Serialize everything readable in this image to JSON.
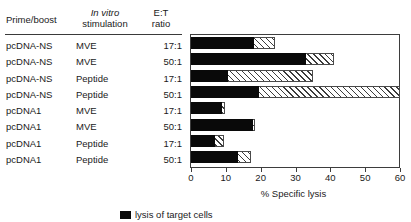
{
  "table": {
    "headers": {
      "prime_boost": "Prime/boost",
      "in_vitro_italic": "In vitro",
      "in_vitro_second": "stimulation",
      "et_line1": "E:T",
      "et_line2": "ratio"
    },
    "rows": [
      {
        "prime_boost": "pcDNA-NS",
        "stimulation": "MVE",
        "et_ratio": "17:1"
      },
      {
        "prime_boost": "pcDNA-NS",
        "stimulation": "MVE",
        "et_ratio": "50:1"
      },
      {
        "prime_boost": "pcDNA-NS",
        "stimulation": "Peptide",
        "et_ratio": "17:1"
      },
      {
        "prime_boost": "pcDNA-NS",
        "stimulation": "Peptide",
        "et_ratio": "50:1"
      },
      {
        "prime_boost": "pcDNA1",
        "stimulation": "MVE",
        "et_ratio": "17:1"
      },
      {
        "prime_boost": "pcDNA1",
        "stimulation": "MVE",
        "et_ratio": "50:1"
      },
      {
        "prime_boost": "pcDNA1",
        "stimulation": "Peptide",
        "et_ratio": "17:1"
      },
      {
        "prime_boost": "pcDNA1",
        "stimulation": "Peptide",
        "et_ratio": "50:1"
      }
    ]
  },
  "legend": {
    "items": [
      {
        "swatch": "black-solid",
        "label": "lysis of target cells"
      }
    ]
  },
  "chart_data": {
    "type": "bar",
    "orientation": "horizontal",
    "title": "",
    "xlabel": "% Specific lysis",
    "ylabel": "",
    "xlim": [
      0,
      60
    ],
    "xticks": [
      0,
      10,
      20,
      30,
      40,
      50,
      60
    ],
    "xticklabels": [
      "0",
      "10",
      "20",
      "30",
      "40",
      "50",
      "60"
    ],
    "grid": false,
    "legend_position": "bottom",
    "categories": [
      "pcDNA-NS / MVE / 17:1",
      "pcDNA-NS / MVE / 50:1",
      "pcDNA-NS / Peptide / 17:1",
      "pcDNA-NS / Peptide / 50:1",
      "pcDNA1 / MVE / 17:1",
      "pcDNA1 / MVE / 50:1",
      "pcDNA1 / Peptide / 17:1",
      "pcDNA1 / Peptide / 50:1"
    ],
    "series": [
      {
        "name": "total lysis (hatched)",
        "style": "hatched-open",
        "values": [
          24.0,
          41.0,
          35.0,
          60.0,
          9.7,
          18.3,
          9.5,
          17.2
        ]
      },
      {
        "name": "specific lysis (solid black)",
        "style": "solid-black",
        "values": [
          18.0,
          33.0,
          10.5,
          19.5,
          9.0,
          17.7,
          7.0,
          13.5
        ]
      }
    ]
  }
}
